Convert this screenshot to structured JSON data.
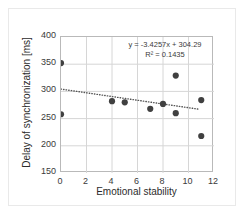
{
  "chart_data": {
    "type": "scatter",
    "title": "",
    "xlabel": "Emotional stability",
    "ylabel": "Delay of synchronization [ms]",
    "xlim": [
      0,
      12
    ],
    "ylim": [
      150,
      400
    ],
    "xticks": [
      0,
      2,
      4,
      6,
      8,
      10,
      12
    ],
    "yticks": [
      150,
      200,
      250,
      300,
      350,
      400
    ],
    "grid": true,
    "legend": "none",
    "series": [
      {
        "name": "observations",
        "marker": "filled-circle",
        "color": "#404040",
        "points": [
          {
            "x": 0,
            "y": 352
          },
          {
            "x": 0,
            "y": 258
          },
          {
            "x": 4,
            "y": 282
          },
          {
            "x": 5,
            "y": 280
          },
          {
            "x": 7,
            "y": 268
          },
          {
            "x": 8,
            "y": 277
          },
          {
            "x": 9,
            "y": 329
          },
          {
            "x": 9,
            "y": 260
          },
          {
            "x": 11,
            "y": 284
          },
          {
            "x": 11,
            "y": 218
          }
        ]
      }
    ],
    "trendline": {
      "type": "linear",
      "style": "dotted",
      "color": "#555555",
      "slope": -3.4257,
      "intercept": 304.29,
      "r_squared": 0.1435,
      "x_start": 0,
      "x_end": 10.8
    },
    "annotations": {
      "equation": "y = -3.4257x + 304.29",
      "r_squared": "R² = 0.1435"
    }
  },
  "axis": {
    "y_tick_labels": [
      "400",
      "350",
      "300",
      "250",
      "200",
      "150"
    ],
    "x_tick_labels": [
      "0",
      "2",
      "4",
      "6",
      "8",
      "10",
      "12"
    ],
    "x_title": "Emotional stability",
    "y_title": "Delay of synchronization [ms]"
  },
  "colors": {
    "marker": "#404040",
    "trendline": "#555555",
    "grid": "#d6d6d6",
    "frame": "#b9b9b9",
    "text": "#3a3a3a"
  }
}
